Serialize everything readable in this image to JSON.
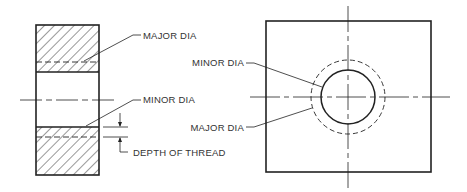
{
  "diagram": {
    "section_view": {
      "labels": {
        "major_dia": "MAJOR DIA",
        "minor_dia": "MINOR DIA",
        "depth_of_thread": "DEPTH OF THREAD"
      }
    },
    "end_view": {
      "labels": {
        "minor_dia": "MINOR DIA",
        "major_dia": "MAJOR DIA"
      }
    },
    "colors": {
      "line": "#222222",
      "text": "#333333",
      "background": "#ffffff"
    }
  }
}
